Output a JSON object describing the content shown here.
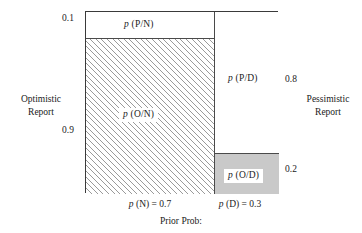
{
  "figure": {
    "caption": "Prior Prob:",
    "side_labels": {
      "left": "Optimistic\nReport",
      "left_line1": "Optimistic",
      "left_line2": "Report",
      "right_line1": "Pessimistic",
      "right_line2": "Report"
    },
    "axis_values": {
      "left_top": "0.1",
      "left_bottom": "0.9",
      "right_top": "0.8",
      "right_bottom": "0.2"
    },
    "column_labels": {
      "normal": "p (N) = 0.7",
      "defective": "p (D) = 0.3"
    },
    "region_labels": {
      "pn": "p (P/N)",
      "on": "p (O/N)",
      "pd": "p (P/D)",
      "od": "p (O/D)"
    },
    "colors": {
      "frame": "#3a3a3a",
      "divider": "#4a4a4a",
      "hatch": "#9a9a9a",
      "grey_fill": "#c9c9c9",
      "white_fill": "#ffffff",
      "text": "#1a1a1a"
    }
  },
  "chart_data": {
    "type": "bar",
    "title": "",
    "subtitle": "",
    "xlabel": "Prior Prob:",
    "ylabel": "",
    "grid": false,
    "legend_position": "none",
    "categories": [
      "N",
      "D"
    ],
    "column_widths": [
      0.7,
      0.3
    ],
    "column_labels": [
      "p (N) = 0.7",
      "p (D) = 0.3"
    ],
    "series": [
      {
        "name": "Pessimistic Report",
        "region_labels": [
          "p (P/N)",
          "p (P/D)"
        ],
        "values": [
          0.1,
          0.8
        ]
      },
      {
        "name": "Optimistic Report",
        "region_labels": [
          "p (O/N)",
          "p (O/D)"
        ],
        "values": [
          0.9,
          0.2
        ]
      }
    ],
    "left_axis_ticks": [
      "0.1",
      "0.9"
    ],
    "right_axis_ticks": [
      "0.8",
      "0.2"
    ],
    "left_axis_label": "Optimistic Report",
    "right_axis_label": "Pessimistic Report",
    "ylim": [
      0,
      1
    ],
    "xlim": [
      0,
      1
    ]
  }
}
